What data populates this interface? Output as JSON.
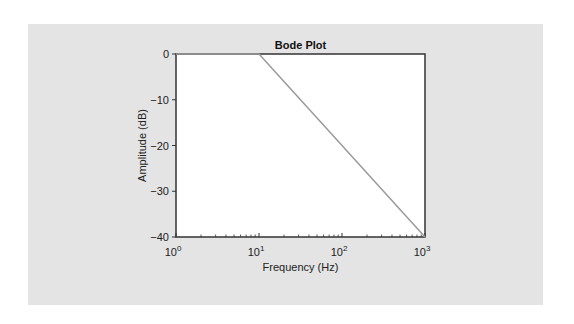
{
  "chart_data": {
    "type": "line",
    "title": "Bode Plot",
    "xlabel": "Frequency (Hz)",
    "ylabel": "Amplitude (dB)",
    "xscale": "log",
    "xlim": [
      1,
      1000
    ],
    "ylim": [
      -40,
      0
    ],
    "x_ticks": [
      "10^0",
      "10^1",
      "10^2",
      "10^3"
    ],
    "y_ticks": [
      "0",
      "−10",
      "−20",
      "−30",
      "−40"
    ],
    "grid": false,
    "legend": null,
    "series": [
      {
        "name": "Amplitude",
        "color": "#9a9a9a",
        "x": [
          1,
          10,
          100,
          1000
        ],
        "y": [
          0,
          0,
          -20,
          -40
        ]
      }
    ]
  },
  "colors": {
    "panel": "#e4e4e4",
    "plot_bg": "#ffffff",
    "axis": "#333333",
    "line": "#9a9a9a"
  }
}
